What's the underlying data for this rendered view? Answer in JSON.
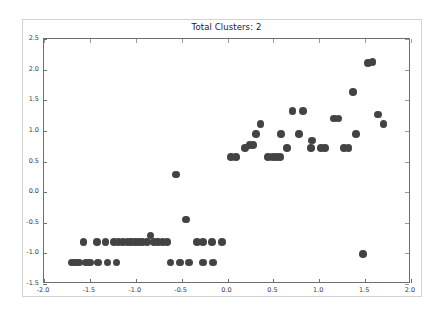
{
  "figure": {
    "title": "Total Clusters: 2",
    "background_color": "#ffffff",
    "frame_color": "#d2d2d2"
  },
  "chart_data": {
    "type": "scatter",
    "title": "Total Clusters: 2",
    "xlabel": "",
    "ylabel": "",
    "xlim": [
      -2.0,
      2.0
    ],
    "ylim": [
      -1.5,
      2.5
    ],
    "grid": false,
    "legend": null,
    "marker_color": "#434343",
    "marker_size": 7.6,
    "xticks": [
      -2.0,
      -1.5,
      -1.0,
      -0.5,
      0.0,
      0.5,
      1.0,
      1.5,
      2.0
    ],
    "xticklabels": [
      "-2.0",
      "-1.5",
      "-1.0",
      "-0.5",
      "0.0",
      "0.5",
      "1.0",
      "1.5",
      "2.0"
    ],
    "yticks": [
      -1.5,
      -1.0,
      -0.5,
      0.0,
      0.5,
      1.0,
      1.5,
      2.0,
      2.5
    ],
    "yticklabels": [
      "-1.5",
      "-1.0",
      "-0.5",
      "0.0",
      "0.5",
      "1.0",
      "1.5",
      "2.0",
      "2.5"
    ],
    "total_clusters": 2,
    "series": [
      {
        "name": "cluster-low",
        "points": [
          [
            -1.7,
            -1.15
          ],
          [
            -1.66,
            -1.15
          ],
          [
            -1.62,
            -1.15
          ],
          [
            -1.54,
            -1.15
          ],
          [
            -1.5,
            -1.15
          ],
          [
            -1.41,
            -1.15
          ],
          [
            -1.31,
            -1.15
          ],
          [
            -1.21,
            -1.15
          ],
          [
            -1.57,
            -0.81
          ],
          [
            -1.42,
            -0.81
          ],
          [
            -1.33,
            -0.81
          ],
          [
            -1.24,
            -0.81
          ],
          [
            -1.19,
            -0.81
          ],
          [
            -1.14,
            -0.81
          ],
          [
            -1.09,
            -0.81
          ],
          [
            -1.05,
            -0.81
          ],
          [
            -1.01,
            -0.81
          ],
          [
            -0.97,
            -0.81
          ],
          [
            -0.93,
            -0.81
          ],
          [
            -0.88,
            -0.81
          ],
          [
            -0.84,
            -0.71
          ],
          [
            -0.8,
            -0.81
          ],
          [
            -0.76,
            -0.81
          ],
          [
            -0.71,
            -0.81
          ],
          [
            -0.66,
            -0.81
          ],
          [
            -0.62,
            -1.15
          ],
          [
            -0.52,
            -1.15
          ],
          [
            -0.42,
            -1.15
          ],
          [
            -0.27,
            -1.15
          ],
          [
            -0.16,
            -1.15
          ],
          [
            -0.33,
            -0.81
          ],
          [
            -0.27,
            -0.81
          ],
          [
            -0.17,
            -0.81
          ],
          [
            -0.06,
            -0.81
          ],
          [
            -0.45,
            -0.45
          ],
          [
            -0.56,
            0.29
          ],
          [
            1.48,
            -1.01
          ]
        ]
      },
      {
        "name": "cluster-high",
        "points": [
          [
            0.04,
            0.57
          ],
          [
            0.09,
            0.57
          ],
          [
            0.19,
            0.72
          ],
          [
            0.24,
            0.77
          ],
          [
            0.28,
            0.77
          ],
          [
            0.31,
            0.95
          ],
          [
            0.36,
            1.11
          ],
          [
            0.44,
            0.57
          ],
          [
            0.49,
            0.57
          ],
          [
            0.53,
            0.57
          ],
          [
            0.57,
            0.57
          ],
          [
            0.58,
            0.95
          ],
          [
            0.65,
            0.72
          ],
          [
            0.71,
            1.32
          ],
          [
            0.82,
            1.32
          ],
          [
            0.78,
            0.95
          ],
          [
            0.92,
            0.84
          ],
          [
            0.91,
            0.72
          ],
          [
            1.02,
            0.72
          ],
          [
            1.06,
            0.72
          ],
          [
            1.16,
            1.2
          ],
          [
            1.21,
            1.2
          ],
          [
            1.27,
            0.72
          ],
          [
            1.32,
            0.72
          ],
          [
            1.37,
            1.63
          ],
          [
            1.4,
            0.95
          ],
          [
            1.53,
            2.11
          ],
          [
            1.58,
            2.12
          ],
          [
            1.64,
            1.27
          ],
          [
            1.7,
            1.11
          ]
        ]
      }
    ]
  }
}
